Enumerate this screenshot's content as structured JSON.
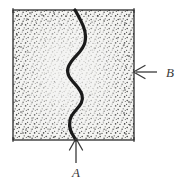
{
  "figure": {
    "caption": "",
    "region": {
      "name": "stippled-square-region",
      "shape": "square",
      "x": 13,
      "y": 10,
      "width": 121,
      "height": 130,
      "fill_color": "#f4f4f2",
      "border_color": "#2b2b2b",
      "stipple_color": "#2f2f2f",
      "stipple_density_edge": "dense",
      "stipple_density_center": "sparse"
    },
    "curve": {
      "name": "wavy-boundary-curve",
      "description": "thick S-shaped vertical curve from top edge to bottom edge",
      "color": "#1a1a1a",
      "stroke_width": 3.2,
      "start_x": 75,
      "start_y": 10,
      "end_x": 76,
      "end_y": 140
    },
    "annotations": [
      {
        "id": "annotation-a",
        "label": "A",
        "arrow_direction": "up",
        "arrow_tip_x": 76,
        "arrow_tip_y": 139,
        "arrow_tail_x": 76,
        "arrow_tail_y": 163,
        "label_x": 76,
        "label_y": 176,
        "color": "#3a3a3a"
      },
      {
        "id": "annotation-b",
        "label": "B",
        "arrow_direction": "left",
        "arrow_tip_x": 134,
        "arrow_tip_y": 72,
        "arrow_tail_x": 156,
        "arrow_tail_y": 72,
        "label_x": 167,
        "label_y": 76,
        "color": "#3a3a3a"
      }
    ]
  }
}
